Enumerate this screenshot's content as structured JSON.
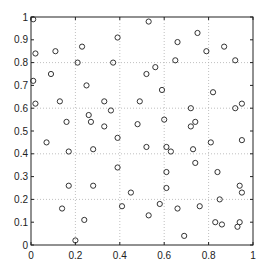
{
  "chart_data": {
    "type": "scatter",
    "title": "",
    "xlabel": "",
    "ylabel": "",
    "xlim": [
      0,
      1
    ],
    "ylim": [
      0,
      1
    ],
    "grid": true,
    "grid_lines_x": [
      0.2,
      0.4,
      0.6,
      0.8
    ],
    "grid_lines_y": [
      0.2,
      0.4,
      0.6,
      0.8
    ],
    "x_ticks": [
      0,
      0.2,
      0.4,
      0.6,
      0.8,
      1
    ],
    "x_tick_labels": [
      "0",
      "0.2",
      "0.4",
      "0.6",
      "0.8",
      "1"
    ],
    "y_ticks": [
      0,
      0.1,
      0.2,
      0.3,
      0.4,
      0.5,
      0.6,
      0.7,
      0.8,
      0.9,
      1
    ],
    "y_tick_labels": [
      "0",
      "0.1",
      "0.2",
      "0.3",
      "0.4",
      "0.5",
      "0.6",
      "0.7",
      "0.8",
      "0.9",
      "1"
    ],
    "marker": "circle-open",
    "marker_color": "#333333",
    "legend": null,
    "series": [
      {
        "name": "points",
        "points": [
          [
            0.01,
            0.99
          ],
          [
            0.02,
            0.84
          ],
          [
            0.11,
            0.85
          ],
          [
            0.23,
            0.87
          ],
          [
            0.39,
            0.91
          ],
          [
            0.21,
            0.8
          ],
          [
            0.37,
            0.8
          ],
          [
            0.01,
            0.72
          ],
          [
            0.09,
            0.75
          ],
          [
            0.25,
            0.7
          ],
          [
            0.02,
            0.62
          ],
          [
            0.13,
            0.63
          ],
          [
            0.33,
            0.63
          ],
          [
            0.36,
            0.59
          ],
          [
            0.26,
            0.57
          ],
          [
            0.16,
            0.54
          ],
          [
            0.27,
            0.54
          ],
          [
            0.33,
            0.52
          ],
          [
            0.53,
            0.98
          ],
          [
            0.75,
            0.93
          ],
          [
            0.66,
            0.89
          ],
          [
            0.87,
            0.87
          ],
          [
            0.79,
            0.85
          ],
          [
            0.56,
            0.78
          ],
          [
            0.52,
            0.75
          ],
          [
            0.65,
            0.81
          ],
          [
            0.92,
            0.81
          ],
          [
            0.59,
            0.68
          ],
          [
            0.82,
            0.67
          ],
          [
            0.49,
            0.63
          ],
          [
            0.72,
            0.6
          ],
          [
            0.92,
            0.6
          ],
          [
            0.95,
            0.62
          ],
          [
            0.6,
            0.55
          ],
          [
            0.48,
            0.53
          ],
          [
            0.74,
            0.54
          ],
          [
            0.72,
            0.52
          ],
          [
            0.07,
            0.45
          ],
          [
            0.17,
            0.41
          ],
          [
            0.28,
            0.42
          ],
          [
            0.39,
            0.47
          ],
          [
            0.39,
            0.34
          ],
          [
            0.17,
            0.26
          ],
          [
            0.28,
            0.26
          ],
          [
            0.45,
            0.23
          ],
          [
            0.14,
            0.16
          ],
          [
            0.41,
            0.17
          ],
          [
            0.24,
            0.11
          ],
          [
            0.2,
            0.02
          ],
          [
            0.52,
            0.43
          ],
          [
            0.61,
            0.43
          ],
          [
            0.63,
            0.41
          ],
          [
            0.73,
            0.42
          ],
          [
            0.81,
            0.45
          ],
          [
            0.95,
            0.46
          ],
          [
            0.74,
            0.36
          ],
          [
            0.61,
            0.32
          ],
          [
            0.84,
            0.32
          ],
          [
            0.61,
            0.25
          ],
          [
            0.94,
            0.26
          ],
          [
            0.95,
            0.23
          ],
          [
            0.85,
            0.2
          ],
          [
            0.58,
            0.18
          ],
          [
            0.66,
            0.16
          ],
          [
            0.76,
            0.17
          ],
          [
            0.53,
            0.13
          ],
          [
            0.83,
            0.1
          ],
          [
            0.86,
            0.09
          ],
          [
            0.93,
            0.08
          ],
          [
            0.94,
            0.1
          ],
          [
            0.69,
            0.04
          ]
        ]
      }
    ]
  }
}
